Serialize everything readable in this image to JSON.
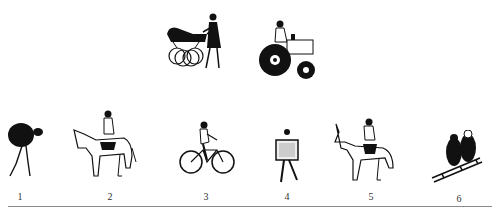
{
  "figure": {
    "top_row": [
      {
        "id": "pram",
        "description": "woman pushing a pram"
      },
      {
        "id": "tractor",
        "description": "man driving a tractor"
      }
    ],
    "bottom_row": [
      {
        "number": "1",
        "description": "person carrying a large load on back"
      },
      {
        "number": "2",
        "description": "person riding a horse"
      },
      {
        "number": "3",
        "description": "person riding a bicycle"
      },
      {
        "number": "4",
        "description": "person walking carrying a box"
      },
      {
        "number": "5",
        "description": "person riding a donkey"
      },
      {
        "number": "6",
        "description": "two children on a sledge"
      }
    ]
  }
}
